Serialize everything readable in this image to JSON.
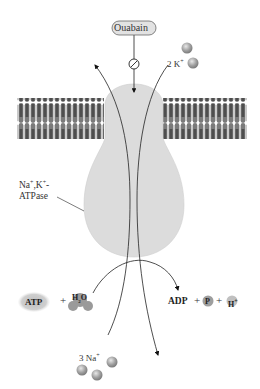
{
  "labels": {
    "inhibitor": "Ouabain",
    "k_ions_count": "2 K",
    "k_ions_charge": "+",
    "enzyme_line1": "Na",
    "enzyme_line1_sup1": "+",
    "enzyme_line1_mid": ",K",
    "enzyme_line1_sup2": "+",
    "enzyme_line1_end": "-",
    "enzyme_line2": "ATPase",
    "atp": "ATP",
    "plus1": "+",
    "water": "H",
    "water_sub": "2",
    "water_end": "O",
    "adp": "ADP",
    "plus2": "+",
    "phosphate": "P",
    "plus3": "+",
    "proton": "H",
    "proton_charge": "+",
    "na_ions_count": "3 Na",
    "na_ions_charge": "+"
  },
  "colors": {
    "membrane": "#6e6e6e",
    "protein": "#dcdcdc",
    "ion": "#a8a8a8",
    "line": "#222222"
  }
}
